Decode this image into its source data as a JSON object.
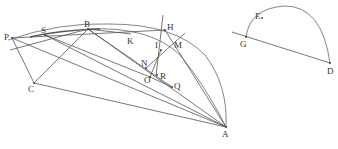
{
  "diagram": {
    "title": "",
    "points": {
      "P": {
        "label": "P",
        "x": 12,
        "y": 38
      },
      "S": {
        "label": "S",
        "x": 45,
        "y": 35
      },
      "B": {
        "label": "B",
        "x": 88,
        "y": 29
      },
      "K": {
        "label": "K",
        "x": 131,
        "y": 34
      },
      "H": {
        "label": "H",
        "x": 165,
        "y": 30
      },
      "I": {
        "label": "I",
        "x": 161,
        "y": 50
      },
      "M": {
        "label": "M",
        "x": 177,
        "y": 40
      },
      "N": {
        "label": "N",
        "x": 146,
        "y": 68
      },
      "O": {
        "label": "O",
        "x": 150,
        "y": 77
      },
      "R": {
        "label": "R",
        "x": 158,
        "y": 76
      },
      "Q": {
        "label": "Q",
        "x": 172,
        "y": 87
      },
      "C": {
        "label": "C",
        "x": 34,
        "y": 83
      },
      "A": {
        "label": "A",
        "x": 226,
        "y": 127
      },
      "G": {
        "label": "G",
        "x": 246,
        "y": 37
      },
      "E": {
        "label": "E",
        "x": 262,
        "y": 18
      },
      "D": {
        "label": "D",
        "x": 330,
        "y": 63
      }
    },
    "labels": [
      "P",
      "S",
      "B",
      "K",
      "H",
      "I",
      "M",
      "N",
      "O",
      "R",
      "Q",
      "C",
      "A",
      "G",
      "E",
      "D"
    ]
  }
}
